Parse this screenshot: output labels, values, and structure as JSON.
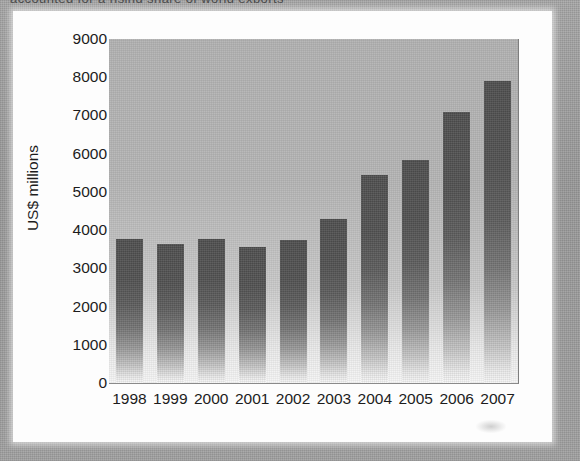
{
  "page": {
    "bleed_through_text": "accounted for a rising share of world exports",
    "background_color": "#9d9d9d",
    "card_color": "#fdfdfd"
  },
  "chart_data": {
    "type": "bar",
    "title": "",
    "subtitle": "",
    "xlabel": "",
    "ylabel": "US$ millions",
    "categories": [
      "1998",
      "1999",
      "2000",
      "2001",
      "2002",
      "2003",
      "2004",
      "2005",
      "2006",
      "2007"
    ],
    "values": [
      3780,
      3650,
      3780,
      3570,
      3740,
      4300,
      5430,
      5830,
      7100,
      7900
    ],
    "series": [
      {
        "name": "US$ millions",
        "values": [
          3780,
          3650,
          3780,
          3570,
          3740,
          4300,
          5430,
          5830,
          7100,
          7900
        ]
      }
    ],
    "ylim": [
      0,
      9000
    ],
    "ytick_labels": [
      "9000",
      "8000",
      "7000",
      "6000",
      "5000",
      "4000",
      "3000",
      "2000",
      "1000",
      "0"
    ],
    "ytick_values": [
      9000,
      8000,
      7000,
      6000,
      5000,
      4000,
      3000,
      2000,
      1000,
      0
    ],
    "ytick_step": 1000,
    "grid": false,
    "legend": null,
    "legend_position": "none",
    "annotations": [],
    "bar_fill": "gradient dark grey fading to white at base",
    "bar_color_top": "#4f4f4f",
    "bar_color_bottom": "#f7f7f7",
    "plot_background": "#b4b4b4"
  }
}
